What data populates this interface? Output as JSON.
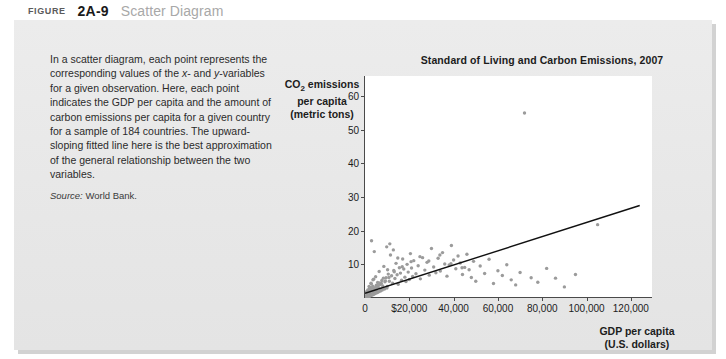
{
  "figure": {
    "label": "FIGURE",
    "number": "2A-9",
    "title": "Scatter Diagram"
  },
  "caption": {
    "paragraph": "In a scatter diagram, each point represents the corresponding values of the x- and y-variables for a given observation. Here, each point indicates the GDP per capita and the amount of carbon emissions per capita for a given country for a sample of 184 countries. The upward-sloping fitted line here is the best approximation of the general relationship between the two variables.",
    "source_word": "Source:",
    "source_text": " World Bank."
  },
  "chart_data": {
    "type": "scatter",
    "title": "Standard of Living and Carbon Emissions, 2007",
    "ylabel": "CO2 emissions per capita (metric tons)",
    "ylabel_line1": "CO",
    "ylabel_sub": "2",
    "ylabel_line1b": " emissions",
    "ylabel_line2": "per capita",
    "ylabel_line3": "(metric tons)",
    "xlabel": "GDP per capita (U.S. dollars)",
    "xlabel_line1": "GDP per capita",
    "xlabel_line2": "(U.S. dollars)",
    "xlim": [
      0,
      130000
    ],
    "ylim": [
      0,
      66
    ],
    "xticks": [
      0,
      20000,
      40000,
      60000,
      80000,
      100000,
      120000
    ],
    "xtick_labels": [
      "0",
      "$20,000",
      "40,000",
      "60,000",
      "80,000",
      "100,000",
      "120,000"
    ],
    "yticks": [
      10,
      20,
      30,
      40,
      50,
      60
    ],
    "ytick_labels": [
      "10",
      "20",
      "30",
      "40",
      "50",
      "60"
    ],
    "grid": false,
    "legend": false,
    "point_color": "#9b9b9b",
    "line_color": "#111111",
    "fit_line": {
      "x0": 0,
      "y0": 1.4,
      "x1": 124000,
      "y1": 27.5
    },
    "n_points": 184,
    "points": [
      [
        300,
        0.2
      ],
      [
        420,
        0.3
      ],
      [
        510,
        0.1
      ],
      [
        620,
        0.4
      ],
      [
        700,
        0.2
      ],
      [
        760,
        0.6
      ],
      [
        820,
        0.3
      ],
      [
        880,
        0.9
      ],
      [
        940,
        0.5
      ],
      [
        1000,
        0.2
      ],
      [
        1060,
        1.1
      ],
      [
        1120,
        0.4
      ],
      [
        1180,
        0.7
      ],
      [
        1240,
        1.3
      ],
      [
        1300,
        0.3
      ],
      [
        1360,
        0.8
      ],
      [
        1420,
        1.6
      ],
      [
        1480,
        0.5
      ],
      [
        1540,
        1.0
      ],
      [
        1600,
        2.1
      ],
      [
        1680,
        0.6
      ],
      [
        1760,
        1.4
      ],
      [
        1840,
        0.9
      ],
      [
        1920,
        2.6
      ],
      [
        2000,
        1.2
      ],
      [
        2100,
        0.7
      ],
      [
        2200,
        1.8
      ],
      [
        2300,
        3.1
      ],
      [
        2400,
        1.1
      ],
      [
        2500,
        2.3
      ],
      [
        2600,
        0.9
      ],
      [
        2700,
        1.5
      ],
      [
        2850,
        4.2
      ],
      [
        3000,
        1.9
      ],
      [
        3150,
        2.8
      ],
      [
        3300,
        1.3
      ],
      [
        3500,
        3.5
      ],
      [
        3700,
        2.2
      ],
      [
        3900,
        5.6
      ],
      [
        4100,
        1.7
      ],
      [
        4300,
        3.0
      ],
      [
        4500,
        2.5
      ],
      [
        4800,
        6.3
      ],
      [
        5100,
        3.8
      ],
      [
        5400,
        2.0
      ],
      [
        5700,
        4.6
      ],
      [
        6000,
        3.2
      ],
      [
        6400,
        7.9
      ],
      [
        6800,
        4.0
      ],
      [
        7200,
        2.7
      ],
      [
        7600,
        5.2
      ],
      [
        8000,
        3.6
      ],
      [
        8500,
        9.4
      ],
      [
        9000,
        4.8
      ],
      [
        9500,
        6.0
      ],
      [
        10000,
        3.4
      ],
      [
        10500,
        7.1
      ],
      [
        11000,
        5.0
      ],
      [
        11500,
        12.8
      ],
      [
        12000,
        6.6
      ],
      [
        12500,
        4.4
      ],
      [
        13000,
        8.2
      ],
      [
        13500,
        5.8
      ],
      [
        14000,
        10.3
      ],
      [
        14500,
        6.9
      ],
      [
        15000,
        4.1
      ],
      [
        15500,
        9.0
      ],
      [
        16000,
        7.4
      ],
      [
        16500,
        5.3
      ],
      [
        17000,
        11.6
      ],
      [
        17500,
        8.6
      ],
      [
        18000,
        6.2
      ],
      [
        18500,
        4.9
      ],
      [
        19000,
        10.0
      ],
      [
        19500,
        7.7
      ],
      [
        20000,
        5.5
      ],
      [
        20500,
        13.2
      ],
      [
        21000,
        8.9
      ],
      [
        21500,
        6.4
      ],
      [
        22000,
        11.1
      ],
      [
        23000,
        7.2
      ],
      [
        24000,
        9.6
      ],
      [
        25000,
        5.7
      ],
      [
        26000,
        12.0
      ],
      [
        27000,
        8.3
      ],
      [
        28000,
        10.6
      ],
      [
        29000,
        6.8
      ],
      [
        30000,
        14.7
      ],
      [
        31000,
        9.2
      ],
      [
        32000,
        7.5
      ],
      [
        33000,
        11.8
      ],
      [
        34000,
        8.0
      ],
      [
        35000,
        13.5
      ],
      [
        36000,
        10.1
      ],
      [
        37000,
        6.5
      ],
      [
        38000,
        9.8
      ],
      [
        39000,
        15.6
      ],
      [
        40000,
        11.3
      ],
      [
        41000,
        8.7
      ],
      [
        42000,
        12.5
      ],
      [
        43000,
        10.4
      ],
      [
        44000,
        7.0
      ],
      [
        45000,
        9.1
      ],
      [
        46000,
        13.0
      ],
      [
        47000,
        8.4
      ],
      [
        48000,
        6.1
      ],
      [
        49000,
        10.9
      ],
      [
        50000,
        5.0
      ],
      [
        52000,
        9.5
      ],
      [
        54000,
        7.3
      ],
      [
        56000,
        11.5
      ],
      [
        58000,
        4.3
      ],
      [
        60000,
        8.1
      ],
      [
        62000,
        6.7
      ],
      [
        64000,
        9.9
      ],
      [
        66000,
        5.4
      ],
      [
        68000,
        3.9
      ],
      [
        70000,
        7.6
      ],
      [
        72000,
        55.0
      ],
      [
        75000,
        6.0
      ],
      [
        78000,
        4.7
      ],
      [
        82000,
        8.8
      ],
      [
        86000,
        5.9
      ],
      [
        90000,
        3.3
      ],
      [
        95000,
        7.0
      ],
      [
        105000,
        21.8
      ],
      [
        2950,
        17.0
      ],
      [
        4200,
        13.8
      ],
      [
        9800,
        15.2
      ],
      [
        12800,
        14.3
      ],
      [
        11200,
        16.1
      ],
      [
        900,
        0.1
      ],
      [
        1150,
        0.15
      ],
      [
        1350,
        0.25
      ],
      [
        1550,
        0.35
      ],
      [
        650,
        0.12
      ],
      [
        480,
        0.08
      ],
      [
        350,
        0.05
      ],
      [
        260,
        0.04
      ],
      [
        210,
        0.03
      ],
      [
        1700,
        0.45
      ],
      [
        1950,
        0.55
      ],
      [
        2250,
        0.65
      ],
      [
        2550,
        0.75
      ],
      [
        2950,
        0.85
      ],
      [
        3400,
        0.95
      ],
      [
        3800,
        1.05
      ],
      [
        4400,
        1.25
      ],
      [
        5000,
        1.45
      ],
      [
        5600,
        1.65
      ],
      [
        6200,
        1.85
      ],
      [
        7000,
        2.05
      ],
      [
        7800,
        2.35
      ],
      [
        8800,
        2.65
      ],
      [
        9900,
        2.95
      ],
      [
        720,
        1.9
      ],
      [
        1250,
        2.4
      ],
      [
        1850,
        3.4
      ],
      [
        2700,
        4.4
      ],
      [
        3600,
        5.4
      ],
      [
        4600,
        2.9
      ],
      [
        5800,
        3.7
      ],
      [
        7400,
        4.3
      ],
      [
        9200,
        5.1
      ],
      [
        10800,
        6.1
      ],
      [
        13200,
        7.8
      ],
      [
        16800,
        9.3
      ],
      [
        20800,
        10.8
      ],
      [
        24800,
        12.3
      ],
      [
        28800,
        11.0
      ],
      [
        33800,
        12.8
      ],
      [
        38800,
        10.2
      ],
      [
        43800,
        9.0
      ],
      [
        400,
        0.06
      ],
      [
        560,
        0.09
      ],
      [
        880,
        1.35
      ],
      [
        1450,
        1.55
      ],
      [
        2050,
        2.15
      ],
      [
        2800,
        2.55
      ],
      [
        3450,
        1.75
      ],
      [
        4950,
        3.15
      ],
      [
        6600,
        4.5
      ],
      [
        8300,
        5.9
      ],
      [
        10200,
        8.4
      ],
      [
        14800,
        11.9
      ]
    ]
  }
}
